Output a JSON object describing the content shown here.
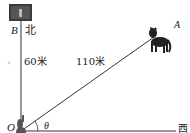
{
  "diagram": {
    "points": {
      "B": "B",
      "A": "A",
      "O": "O"
    },
    "directions": {
      "north": "北",
      "west": "西"
    },
    "distances": {
      "OB": "60米",
      "OA": "110米"
    },
    "angle": "θ",
    "icons": {
      "top": "tree-photo",
      "A": "wolf",
      "O": "rabbit"
    }
  }
}
